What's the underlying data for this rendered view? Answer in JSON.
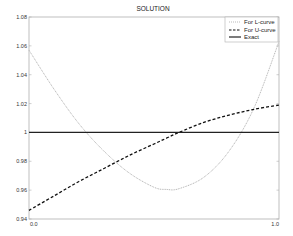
{
  "chart_data": {
    "type": "line",
    "title": "SOLUTION",
    "xlabel": "",
    "ylabel": "",
    "xlim": [
      0.0,
      1.0
    ],
    "ylim": [
      0.94,
      1.08
    ],
    "x_tick_labels": [
      "0.0",
      "1.0"
    ],
    "y_ticks": [
      0.94,
      0.96,
      0.98,
      1.0,
      1.02,
      1.04,
      1.06,
      1.08
    ],
    "y_tick_labels": [
      "0.94",
      "0.96",
      "0.98",
      "1",
      "1.02",
      "1.04",
      "1.06",
      "1.08"
    ],
    "grid": false,
    "legend_position": "upper right",
    "x": [
      0.0,
      0.1,
      0.2,
      0.3,
      0.4,
      0.5,
      0.55,
      0.6,
      0.7,
      0.8,
      0.9,
      1.0
    ],
    "series": [
      {
        "name": "For L-curve",
        "style": "dotted",
        "color": "#aaaaaa",
        "values": [
          1.057,
          1.03,
          1.006,
          0.987,
          0.972,
          0.962,
          0.9605,
          0.961,
          0.969,
          0.987,
          1.017,
          1.063
        ]
      },
      {
        "name": "For U-curve",
        "style": "dashed",
        "color": "#111111",
        "values": [
          0.946,
          0.956,
          0.966,
          0.975,
          0.984,
          0.992,
          0.996,
          1.0,
          1.007,
          1.012,
          1.016,
          1.019
        ]
      },
      {
        "name": "Exact",
        "style": "solid",
        "color": "#222222",
        "values": [
          1.0,
          1.0,
          1.0,
          1.0,
          1.0,
          1.0,
          1.0,
          1.0,
          1.0,
          1.0,
          1.0,
          1.0
        ]
      }
    ]
  },
  "legend": {
    "items": [
      "For L-curve",
      "For U-curve",
      "Exact"
    ]
  }
}
